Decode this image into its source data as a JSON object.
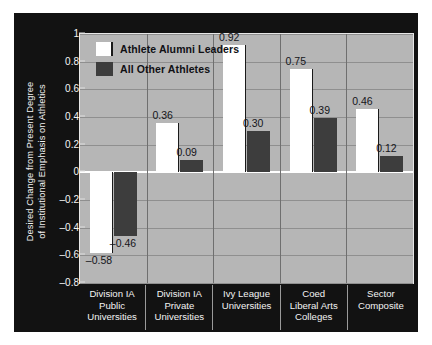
{
  "chart_data": {
    "type": "bar",
    "title": "",
    "xlabel": "",
    "ylabel": "Desired Change from Present Degree\nof Institutional Emphasis on Athletics",
    "categories": [
      "Division IA\nPublic\nUniversities",
      "Division IA\nPrivate\nUniversities",
      "Ivy League\nUniversities",
      "Coed\nLiberal Arts\nColleges",
      "Sector\nComposite"
    ],
    "series": [
      {
        "name": "Athlete Alumni Leaders",
        "color": "#ffffff",
        "values": [
          -0.58,
          0.36,
          0.92,
          0.75,
          0.46
        ],
        "labels": [
          "–0.58",
          "0.36",
          "0.92",
          "0.75",
          "0.46"
        ]
      },
      {
        "name": "All Other Athletes",
        "color": "#3d3d3d",
        "values": [
          -0.46,
          0.09,
          0.3,
          0.39,
          0.12
        ],
        "labels": [
          "–0.46",
          "0.09",
          "0.30",
          "0.39",
          "0.12"
        ]
      }
    ],
    "ylim": [
      -0.8,
      1.0
    ],
    "yticks": [
      1,
      0.8,
      0.6,
      0.4,
      0.2,
      0,
      -0.2,
      -0.4,
      -0.6,
      -0.8
    ],
    "ytick_labels": [
      "1",
      "0.8",
      "0.6",
      "0.4",
      "0.2",
      "0",
      "–0.2",
      "–0.4",
      "–0.6",
      "–0.8"
    ],
    "grid": true,
    "legend_position": "top-left",
    "plot_background": "#b6b6b6",
    "figure_background": "#121212",
    "zero_line_color": "#ffffff"
  }
}
